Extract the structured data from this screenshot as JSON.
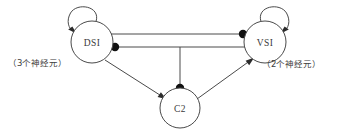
{
  "figure": {
    "type": "neural-circuit-diagram",
    "background_color": "#ffffff",
    "line_color": "#4a4a4a",
    "marker_color": "#111111"
  },
  "nodes": [
    {
      "id": "DSI",
      "label": "DSI",
      "cx": 92,
      "cy": 42,
      "r": 21,
      "note": "3 neurons"
    },
    {
      "id": "VSI",
      "label": "VSI",
      "cx": 265,
      "cy": 42,
      "r": 21,
      "note": "2 neurons"
    },
    {
      "id": "C2",
      "label": "C2",
      "cx": 180,
      "cy": 108,
      "r": 20,
      "note": ""
    }
  ],
  "annotations": {
    "left_label": "（3个神经元）",
    "right_label": "（2个神经元）"
  },
  "edges": [
    {
      "id": "dsi-self",
      "from": "DSI",
      "to": "DSI",
      "kind": "self-loop",
      "terminal": "arrow"
    },
    {
      "id": "vsi-self",
      "from": "VSI",
      "to": "VSI",
      "kind": "self-loop",
      "terminal": "arrow"
    },
    {
      "id": "dsi-to-vsi",
      "from": "DSI",
      "to": "VSI",
      "kind": "straight",
      "terminal": "inhibitory-dot"
    },
    {
      "id": "vsi-to-dsi",
      "from": "VSI",
      "to": "DSI",
      "kind": "straight",
      "terminal": "inhibitory-dot"
    },
    {
      "id": "branch-to-c2",
      "from": "VSI",
      "to": "C2",
      "kind": "branch-vertical",
      "terminal": "inhibitory-dot"
    },
    {
      "id": "dsi-to-c2",
      "from": "DSI",
      "to": "C2",
      "kind": "straight",
      "terminal": "arrow"
    },
    {
      "id": "c2-to-vsi",
      "from": "C2",
      "to": "VSI",
      "kind": "straight",
      "terminal": "arrow"
    }
  ],
  "legend": {
    "arrow_meaning": "excitatory",
    "dot_meaning": "inhibitory"
  }
}
